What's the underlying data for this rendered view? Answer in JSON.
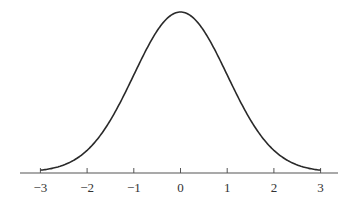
{
  "chart_data": {
    "type": "line",
    "title": "",
    "xlabel": "",
    "ylabel": "",
    "series": [
      {
        "name": "standard normal density",
        "function": "exp(-x^2/2)/sqrt(2*pi)",
        "x": [
          -3,
          -2.5,
          -2,
          -1.5,
          -1,
          -0.5,
          0,
          0.5,
          1,
          1.5,
          2,
          2.5,
          3
        ],
        "values": [
          0.0044,
          0.0175,
          0.054,
          0.1295,
          0.242,
          0.3521,
          0.3989,
          0.3521,
          0.242,
          0.1295,
          0.054,
          0.0175,
          0.0044
        ]
      }
    ],
    "xticks": [
      -3,
      -2,
      -1,
      0,
      1,
      2,
      3
    ],
    "xtick_labels": [
      "−3",
      "−2",
      "−1",
      "0",
      "1",
      "2",
      "3"
    ],
    "xlim": [
      -3.4,
      3.4
    ],
    "y_axis_visible": false,
    "grid": false,
    "legend": "none"
  },
  "colors": {
    "curve": "#2a2a2a",
    "axis": "#555555",
    "background": "#ffffff"
  },
  "axis": {
    "ticks": [
      {
        "value": -3,
        "label": "−3"
      },
      {
        "value": -2,
        "label": "−2"
      },
      {
        "value": -1,
        "label": "−1"
      },
      {
        "value": 0,
        "label": "0"
      },
      {
        "value": 1,
        "label": "1"
      },
      {
        "value": 2,
        "label": "2"
      },
      {
        "value": 3,
        "label": "3"
      }
    ]
  }
}
